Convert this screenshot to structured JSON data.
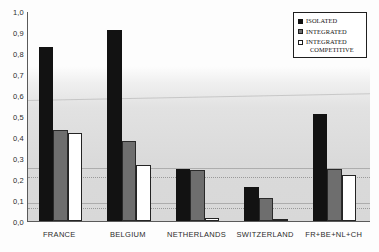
{
  "chart_data": {
    "type": "bar",
    "title": "",
    "xlabel": "",
    "ylabel": "",
    "ylim": [
      0.0,
      1.0
    ],
    "grid": false,
    "legend_position": "top-right",
    "decimal_separator": ",",
    "categories": [
      "FRANCE",
      "BELGIUM",
      "NETHERLANDS",
      "SWITZERLAND",
      "FR+BE+NL+CH"
    ],
    "ytick_labels": [
      "0,0",
      "0,1",
      "0,2",
      "0,3",
      "0,4",
      "0,5",
      "0,6",
      "0,7",
      "0,8",
      "0,9",
      "1,0"
    ],
    "ytick_values": [
      0.0,
      0.1,
      0.2,
      0.3,
      0.4,
      0.5,
      0.6,
      0.7,
      0.8,
      0.9,
      1.0
    ],
    "series": [
      {
        "name": "ISOLATED",
        "color": "#121212",
        "values": [
          0.83,
          0.91,
          0.25,
          0.16,
          0.51
        ]
      },
      {
        "name": "INTEGRATED",
        "color": "#6e6e6e",
        "values": [
          0.435,
          0.38,
          0.245,
          0.11,
          0.25
        ]
      },
      {
        "name": "INTEGRATED COMPETITIVE",
        "color": "#ffffff",
        "values": [
          0.42,
          0.265,
          0.015,
          0.005,
          0.22
        ]
      }
    ]
  },
  "legend": {
    "entries": [
      {
        "label": "ISOLATED",
        "label_line2": "",
        "swatch": "black-square-icon"
      },
      {
        "label": "INTEGRATED",
        "label_line2": "",
        "swatch": "gray-square-icon"
      },
      {
        "label": "INTEGRATED",
        "label_line2": "COMPETITIVE",
        "swatch": "white-square-icon"
      }
    ]
  }
}
